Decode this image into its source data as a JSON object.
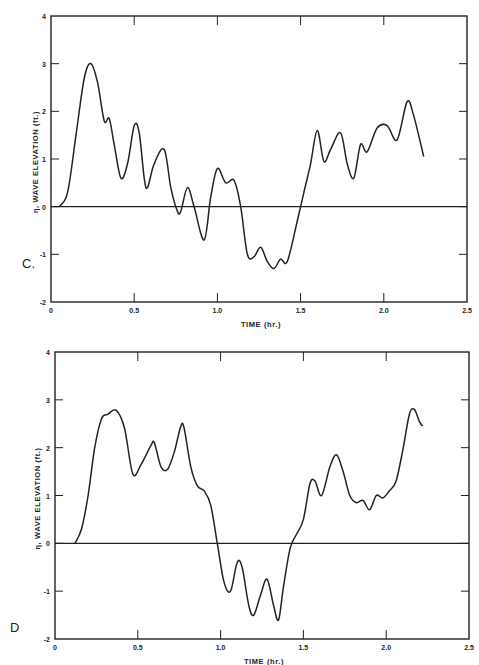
{
  "chart_data": [
    {
      "type": "line",
      "panel": "C.",
      "title": "",
      "xlabel": "TIME (hr.)",
      "ylabel": "η, WAVE ELEVATION (ft.)",
      "xlim": [
        0,
        2.5
      ],
      "ylim": [
        -2,
        4
      ],
      "xticks": [
        "0",
        "0.5",
        "1.0",
        "1.5",
        "2.0",
        "2.5"
      ],
      "yticks": [
        "-2",
        "-1",
        "0",
        "1",
        "2",
        "3",
        "4"
      ],
      "grid": false,
      "zero_line": true,
      "series": [
        {
          "name": "wave elevation",
          "x": [
            0.05,
            0.1,
            0.15,
            0.2,
            0.24,
            0.28,
            0.32,
            0.35,
            0.38,
            0.42,
            0.46,
            0.5,
            0.53,
            0.56,
            0.58,
            0.62,
            0.68,
            0.72,
            0.76,
            0.78,
            0.82,
            0.86,
            0.92,
            0.96,
            1.0,
            1.05,
            1.1,
            1.14,
            1.18,
            1.22,
            1.26,
            1.3,
            1.34,
            1.38,
            1.42,
            1.48,
            1.52,
            1.56,
            1.6,
            1.64,
            1.68,
            1.74,
            1.78,
            1.82,
            1.86,
            1.9,
            1.96,
            2.02,
            2.08,
            2.14,
            2.18,
            2.24
          ],
          "y": [
            0,
            0.3,
            1.5,
            2.7,
            3.0,
            2.6,
            1.8,
            1.85,
            1.3,
            0.6,
            0.9,
            1.7,
            1.55,
            0.6,
            0.4,
            0.9,
            1.2,
            0.4,
            -0.1,
            -0.1,
            0.4,
            0.0,
            -0.7,
            0.2,
            0.8,
            0.5,
            0.55,
            0,
            -1.0,
            -1.05,
            -0.85,
            -1.15,
            -1.3,
            -1.1,
            -1.15,
            -0.3,
            0.3,
            0.9,
            1.6,
            0.95,
            1.2,
            1.55,
            0.9,
            0.6,
            1.3,
            1.15,
            1.65,
            1.7,
            1.4,
            2.2,
            1.9,
            1.05
          ]
        }
      ]
    },
    {
      "type": "line",
      "panel": "D",
      "title": "",
      "xlabel": "TIME (hr.)",
      "ylabel": "η, WAVE ELEVATION (ft.)",
      "xlim": [
        0,
        2.5
      ],
      "ylim": [
        -2,
        4
      ],
      "xticks": [
        "0",
        "0.5",
        "1.0",
        "1.5",
        "2.0",
        "2.5"
      ],
      "yticks": [
        "-2",
        "-1",
        "0",
        "1",
        "2",
        "3",
        "4"
      ],
      "grid": false,
      "zero_line": true,
      "series": [
        {
          "name": "wave elevation",
          "x": [
            0.12,
            0.16,
            0.2,
            0.24,
            0.28,
            0.32,
            0.37,
            0.42,
            0.47,
            0.52,
            0.58,
            0.6,
            0.64,
            0.68,
            0.72,
            0.76,
            0.78,
            0.82,
            0.86,
            0.9,
            0.94,
            0.98,
            1.02,
            1.06,
            1.1,
            1.13,
            1.17,
            1.2,
            1.24,
            1.28,
            1.32,
            1.35,
            1.38,
            1.42,
            1.46,
            1.5,
            1.54,
            1.57,
            1.61,
            1.66,
            1.7,
            1.74,
            1.78,
            1.82,
            1.86,
            1.9,
            1.94,
            1.98,
            2.02,
            2.06,
            2.1,
            2.14,
            2.17,
            2.2,
            2.22
          ],
          "y": [
            0,
            0.3,
            1.0,
            2.0,
            2.6,
            2.7,
            2.78,
            2.4,
            1.45,
            1.65,
            2.05,
            2.1,
            1.6,
            1.55,
            1.9,
            2.45,
            2.4,
            1.6,
            1.2,
            1.1,
            0.8,
            0,
            -0.8,
            -1.0,
            -0.4,
            -0.5,
            -1.3,
            -1.5,
            -1.1,
            -0.75,
            -1.3,
            -1.6,
            -0.9,
            -0.1,
            0.2,
            0.5,
            1.25,
            1.3,
            1.0,
            1.6,
            1.85,
            1.5,
            1.0,
            0.85,
            0.9,
            0.7,
            1.0,
            0.95,
            1.1,
            1.3,
            1.95,
            2.7,
            2.8,
            2.55,
            2.45
          ]
        }
      ]
    }
  ],
  "panels": [
    {
      "letter": "C.",
      "xlabel": "TIME (hr.)",
      "ylabel": "η, WAVE ELEVATION (ft.)"
    },
    {
      "letter": "D",
      "xlabel": "TIME (hr.)",
      "ylabel": "η, WAVE ELEVATION (ft.)"
    }
  ],
  "colors": {
    "ink": "#222222",
    "background": "#ffffff"
  }
}
